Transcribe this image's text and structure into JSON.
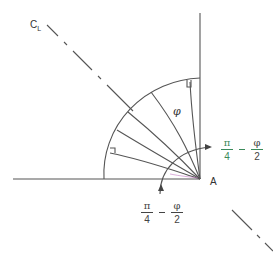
{
  "figure": {
    "centerline_label": "C",
    "centerline_subscript": "L",
    "phi_label": "φ",
    "point_label": "A",
    "angle_label_right": {
      "numerator_1": "π",
      "denominator_1": "4",
      "operator": "−",
      "numerator_2": "φ",
      "denominator_2": "2"
    },
    "angle_label_bottom": {
      "numerator_1": "π",
      "denominator_1": "4",
      "operator": "−",
      "numerator_2": "φ",
      "denominator_2": "2"
    }
  },
  "colors": {
    "line": "#444444",
    "label": "#333333",
    "label_accent": "#3a8a5a"
  }
}
